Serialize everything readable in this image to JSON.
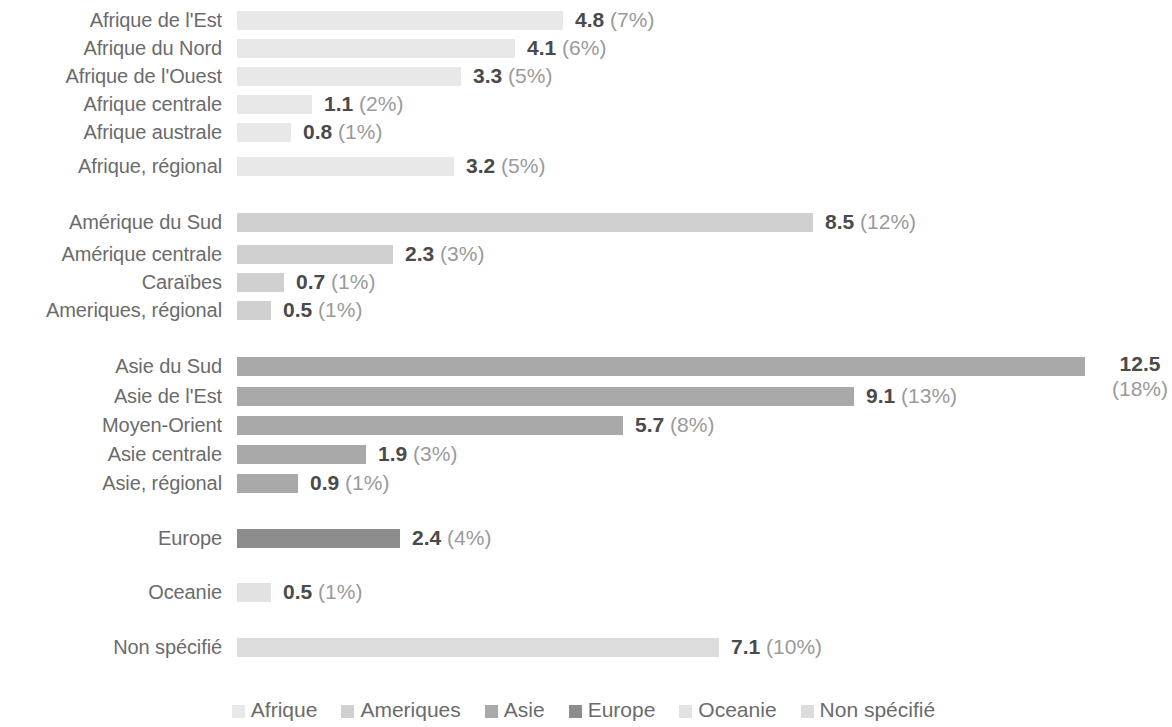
{
  "chart_data": {
    "type": "bar",
    "orientation": "horizontal",
    "title": "",
    "subtitle": "",
    "xlabel": "",
    "ylabel": "",
    "grid": false,
    "legend_position": "bottom",
    "xlim": [
      0,
      13.7
    ],
    "px_per_unit": 67.8,
    "categories": [
      "Afrique de l'Est",
      "Afrique du Nord",
      "Afrique de l'Ouest",
      "Afrique centrale",
      "Afrique australe",
      "Afrique, régional",
      "Amérique du Sud",
      "Amérique centrale",
      "Caraïbes",
      "Ameriques, régional",
      "Asie du Sud",
      "Asie de l'Est",
      "Moyen-Orient",
      "Asie centrale",
      "Asie, régional",
      "Europe",
      "Oceanie",
      "Non spécifié"
    ],
    "values": [
      4.8,
      4.1,
      3.3,
      1.1,
      0.8,
      3.2,
      8.5,
      2.3,
      0.7,
      0.5,
      12.5,
      9.1,
      5.7,
      1.9,
      0.9,
      2.4,
      0.5,
      7.1
    ],
    "percentages": [
      "7%",
      "6%",
      "5%",
      "2%",
      "1%",
      "5%",
      "12%",
      "3%",
      "1%",
      "1%",
      "18%",
      "13%",
      "8%",
      "3%",
      "1%",
      "4%",
      "1%",
      "10%"
    ],
    "series": [
      {
        "name": "Afrique",
        "color": "#e8e8e8"
      },
      {
        "name": "Ameriques",
        "color": "#d0d0d0"
      },
      {
        "name": "Asie",
        "color": "#a9a9a9"
      },
      {
        "name": "Europe",
        "color": "#8c8c8c"
      },
      {
        "name": "Oceanie",
        "color": "#e2e2e2"
      },
      {
        "name": "Non spécifié",
        "color": "#dcdcdc"
      }
    ]
  },
  "rows": [
    {
      "label": "Afrique de l'Est",
      "value": "4.8",
      "pct": "(7%)",
      "group": "Afrique",
      "color": "#e8e8e8",
      "top": 6,
      "width": 326,
      "wrapped": false
    },
    {
      "label": "Afrique du Nord",
      "value": "4.1",
      "pct": "(6%)",
      "group": "Afrique",
      "color": "#e8e8e8",
      "top": 34,
      "width": 278,
      "wrapped": false
    },
    {
      "label": "Afrique de l'Ouest",
      "value": "3.3",
      "pct": "(5%)",
      "group": "Afrique",
      "color": "#e8e8e8",
      "top": 62,
      "width": 224,
      "wrapped": false
    },
    {
      "label": "Afrique centrale",
      "value": "1.1",
      "pct": "(2%)",
      "group": "Afrique",
      "color": "#e8e8e8",
      "top": 90,
      "width": 75,
      "wrapped": false
    },
    {
      "label": "Afrique australe",
      "value": "0.8",
      "pct": "(1%)",
      "group": "Afrique",
      "color": "#e8e8e8",
      "top": 118,
      "width": 54,
      "wrapped": false
    },
    {
      "label": "Afrique, régional",
      "value": "3.2",
      "pct": "(5%)",
      "group": "Afrique",
      "color": "#e8e8e8",
      "top": 152,
      "width": 217,
      "wrapped": false
    },
    {
      "label": "Amérique du Sud",
      "value": "8.5",
      "pct": "(12%)",
      "group": "Ameriques",
      "color": "#d0d0d0",
      "top": 208,
      "width": 576,
      "wrapped": false
    },
    {
      "label": "Amérique centrale",
      "value": "2.3",
      "pct": "(3%)",
      "group": "Ameriques",
      "color": "#d0d0d0",
      "top": 240,
      "width": 156,
      "wrapped": false
    },
    {
      "label": "Caraïbes",
      "value": "0.7",
      "pct": "(1%)",
      "group": "Ameriques",
      "color": "#d0d0d0",
      "top": 268,
      "width": 47,
      "wrapped": false
    },
    {
      "label": "Ameriques, régional",
      "value": "0.5",
      "pct": "(1%)",
      "group": "Ameriques",
      "color": "#d0d0d0",
      "top": 296,
      "width": 34,
      "wrapped": false
    },
    {
      "label": "Asie du Sud",
      "value": "12.5",
      "pct": "(18%)",
      "group": "Asie",
      "color": "#a9a9a9",
      "top": 352,
      "width": 848,
      "wrapped": true
    },
    {
      "label": "Asie de l'Est",
      "value": "9.1",
      "pct": "(13%)",
      "group": "Asie",
      "color": "#a9a9a9",
      "top": 382,
      "width": 617,
      "wrapped": false
    },
    {
      "label": "Moyen-Orient",
      "value": "5.7",
      "pct": "(8%)",
      "group": "Asie",
      "color": "#a9a9a9",
      "top": 411,
      "width": 386,
      "wrapped": false
    },
    {
      "label": "Asie centrale",
      "value": "1.9",
      "pct": "(3%)",
      "group": "Asie",
      "color": "#a9a9a9",
      "top": 440,
      "width": 129,
      "wrapped": false
    },
    {
      "label": "Asie, régional",
      "value": "0.9",
      "pct": "(1%)",
      "group": "Asie",
      "color": "#a9a9a9",
      "top": 469,
      "width": 61,
      "wrapped": false
    },
    {
      "label": "Europe",
      "value": "2.4",
      "pct": "(4%)",
      "group": "Europe",
      "color": "#8c8c8c",
      "top": 524,
      "width": 163,
      "wrapped": false
    },
    {
      "label": "Oceanie",
      "value": "0.5",
      "pct": "(1%)",
      "group": "Oceanie",
      "color": "#e2e2e2",
      "top": 578,
      "width": 34,
      "wrapped": false
    },
    {
      "label": "Non spécifié",
      "value": "7.1",
      "pct": "(10%)",
      "group": "Non spécifié",
      "color": "#dcdcdc",
      "top": 633,
      "width": 482,
      "wrapped": false
    }
  ],
  "legend": {
    "items": [
      {
        "label": "Afrique",
        "color": "#e8e8e8"
      },
      {
        "label": "Ameriques",
        "color": "#d0d0d0"
      },
      {
        "label": "Asie",
        "color": "#a9a9a9"
      },
      {
        "label": "Europe",
        "color": "#8c8c8c"
      },
      {
        "label": "Oceanie",
        "color": "#e2e2e2"
      },
      {
        "label": "Non spécifié",
        "color": "#dcdcdc"
      }
    ]
  }
}
